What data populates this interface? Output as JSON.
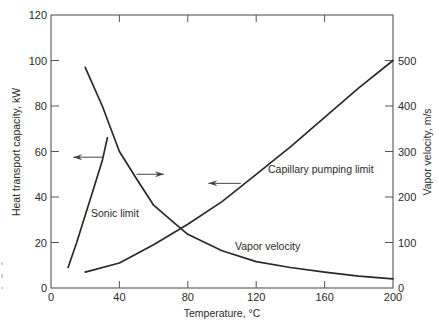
{
  "chart_data": {
    "type": "line",
    "title": "",
    "xlabel": "Temperature, °C",
    "ylabel": "Heat transport capacity, kW",
    "y2label": "Vapor velocity, m/s",
    "xlim": [
      0,
      200
    ],
    "ylim": [
      0,
      120
    ],
    "y2lim": [
      0,
      600
    ],
    "x_ticks": [
      0,
      40,
      80,
      120,
      160,
      200
    ],
    "y_ticks": [
      0,
      20,
      40,
      60,
      80,
      100,
      120
    ],
    "y2_ticks": [
      0,
      100,
      200,
      300,
      400,
      500
    ],
    "grid": false,
    "legend": "none (inline annotations)",
    "series": [
      {
        "name": "Sonic limit",
        "axis": "left",
        "x": [
          10,
          15,
          20,
          25,
          30,
          33
        ],
        "values": [
          9,
          20,
          32,
          44,
          56,
          66
        ]
      },
      {
        "name": "Vapor velocity",
        "axis": "right",
        "x": [
          20,
          30,
          40,
          50,
          60,
          70,
          80,
          100,
          120,
          140,
          160,
          180,
          200
        ],
        "values": [
          485,
          400,
          300,
          240,
          182,
          150,
          118,
          82,
          58,
          45,
          35,
          26,
          20
        ]
      },
      {
        "name": "Capillary pumping limit",
        "axis": "left",
        "x": [
          20,
          40,
          60,
          80,
          100,
          120,
          140,
          160,
          180,
          200
        ],
        "values": [
          7,
          11,
          19,
          28,
          38,
          50,
          62,
          75,
          88,
          100
        ]
      }
    ],
    "annotations": [
      {
        "text": "Sonic limit",
        "x": 24,
        "y": 36
      },
      {
        "text": "Vapor velocity",
        "x": 104,
        "y": 20
      },
      {
        "text": "Capillary pumping limit",
        "x": 127,
        "y": 46
      },
      {
        "text": "arrow-left (Sonic limit → left axis)",
        "x_from": 31,
        "x_to": 13,
        "y": 57.5
      },
      {
        "text": "arrow-right (Vapor velocity → right axis)",
        "x_from": 50,
        "x_to": 66,
        "y": 50
      },
      {
        "text": "arrow-left (Capillary limit → left axis)",
        "x_from": 111,
        "x_to": 92,
        "y": 46
      }
    ]
  },
  "labels": {
    "xlabel": "Temperature, °C",
    "ylabel": "Heat transport capacity, kW",
    "y2label": "Vapor velocity, m/s",
    "sonic": "Sonic limit",
    "vapor": "Vapor velocity",
    "capillary": "Capillary pumping limit"
  }
}
